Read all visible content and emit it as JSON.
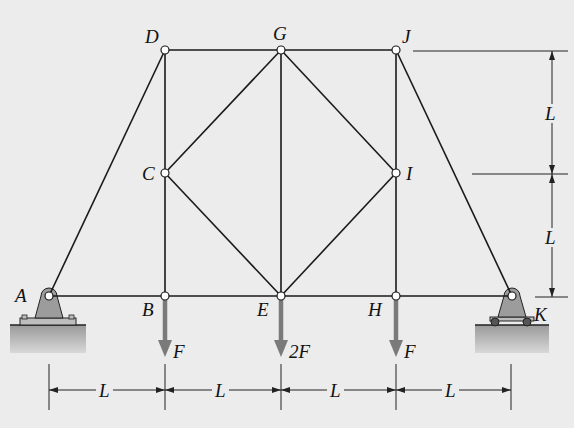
{
  "diagram": {
    "type": "truss",
    "joints": [
      {
        "id": "A",
        "x": 49,
        "y": 296,
        "label": "A",
        "support": "pin"
      },
      {
        "id": "B",
        "x": 165,
        "y": 296,
        "label": "B"
      },
      {
        "id": "C",
        "x": 165,
        "y": 173,
        "label": "C"
      },
      {
        "id": "D",
        "x": 165,
        "y": 50,
        "label": "D"
      },
      {
        "id": "E",
        "x": 281,
        "y": 296,
        "label": "E"
      },
      {
        "id": "G",
        "x": 281,
        "y": 50,
        "label": "G"
      },
      {
        "id": "H",
        "x": 396,
        "y": 296,
        "label": "H"
      },
      {
        "id": "I",
        "x": 396,
        "y": 173,
        "label": "I"
      },
      {
        "id": "J",
        "x": 396,
        "y": 50,
        "label": "J"
      },
      {
        "id": "K",
        "x": 512,
        "y": 296,
        "label": "K",
        "support": "roller"
      }
    ],
    "members": [
      [
        "A",
        "B"
      ],
      [
        "B",
        "E"
      ],
      [
        "E",
        "H"
      ],
      [
        "H",
        "K"
      ],
      [
        "D",
        "G"
      ],
      [
        "G",
        "J"
      ],
      [
        "A",
        "D"
      ],
      [
        "J",
        "K"
      ],
      [
        "B",
        "C"
      ],
      [
        "C",
        "D"
      ],
      [
        "E",
        "G"
      ],
      [
        "H",
        "I"
      ],
      [
        "I",
        "J"
      ],
      [
        "C",
        "G"
      ],
      [
        "C",
        "E"
      ],
      [
        "G",
        "I"
      ],
      [
        "E",
        "I"
      ]
    ],
    "loads": [
      {
        "joint": "B",
        "label": "F"
      },
      {
        "joint": "E",
        "label": "2F"
      },
      {
        "joint": "H",
        "label": "F"
      }
    ],
    "horizontal_dimensions": [
      "L",
      "L",
      "L",
      "L"
    ],
    "vertical_dimensions": [
      "L",
      "L"
    ],
    "colors": {
      "background": "#ececec",
      "member": "#1a1a1a",
      "load_arrow": "#7a7a7a",
      "support_fill": "#9c9c9c",
      "ground_fill": "#b0b0b0"
    }
  }
}
